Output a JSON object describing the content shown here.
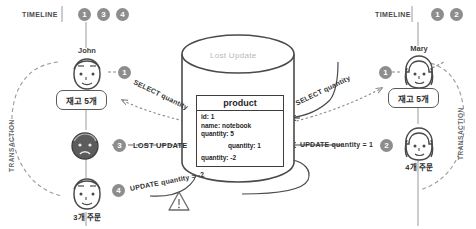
{
  "diagram": {
    "title": "Lost Update",
    "left_timeline": {
      "label": "TIMELINE",
      "badges": [
        "1",
        "3",
        "4"
      ]
    },
    "right_timeline": {
      "label": "TIMELINE",
      "badges": [
        "1",
        "2"
      ]
    },
    "transaction_label_left": "TRANSACTION",
    "transaction_label_right": "TRANSACTION",
    "actors": {
      "john": {
        "name": "John",
        "step_badge": "1",
        "stock_box": "재고 5개",
        "order_label": "3개 주문",
        "lost_badge": "3",
        "lost_text": "LOST UPDATE",
        "update_badge": "4",
        "update_text": "UPDATE quantity = -2",
        "select_text": "SELECT quantity",
        "warning_icon": "warning-triangle-icon"
      },
      "mary": {
        "name": "Mary",
        "step_badge": "1",
        "stock_box": "재고 5개",
        "order_label": "4개 주문",
        "update_badge": "2",
        "update_text": "UPDATE quantity = 1",
        "select_text": "SELECT quantity"
      }
    },
    "database": {
      "label": "Lost Update",
      "table_name": "product",
      "rows": [
        "id: 1",
        "name: notebook",
        "quantity: 5"
      ],
      "row_indent": "quantity: 1",
      "row_last": "quantity: -2"
    },
    "colors": {
      "stroke": "#5a5a5a",
      "badge": "#8d8d8d",
      "muted_text": "#b8b8b8",
      "dark_face": "#5c5c5c",
      "background": "#ffffff"
    }
  }
}
